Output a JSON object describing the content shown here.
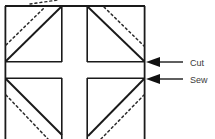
{
  "figure": {
    "background_color": "#ffffff",
    "line_color": "#1a1a1a",
    "dash_color": "#2b2b2b",
    "label_color": "#3a3a3a",
    "canvas": {
      "width": 215,
      "height": 139
    }
  },
  "block": {
    "outer_square": {
      "x": 5,
      "y": 6,
      "width": 140,
      "height": 140
    },
    "gap_cross": {
      "vertical_gap": {
        "x1": 62,
        "x2": 87
      },
      "horizontal_gap": {
        "y1": 62,
        "y2": 78
      }
    },
    "quadrants": [
      {
        "name": "top-left",
        "x": 5,
        "y": 6,
        "width": 57,
        "height": 56,
        "solid_diagonal": "bottom-left-to-top-right",
        "dashed_offset_direction": "up-left"
      },
      {
        "name": "top-right",
        "x": 87,
        "y": 6,
        "width": 58,
        "height": 56,
        "solid_diagonal": "top-left-to-bottom-right",
        "dashed_offset_direction": "up-right"
      },
      {
        "name": "bottom-left",
        "x": 5,
        "y": 78,
        "width": 57,
        "height": 61,
        "solid_diagonal": "top-left-to-bottom-right",
        "dashed_offset_direction": "down-left"
      },
      {
        "name": "bottom-right",
        "x": 87,
        "y": 78,
        "width": 58,
        "height": 61,
        "solid_diagonal": "bottom-left-to-top-right",
        "dashed_offset_direction": "down-right"
      }
    ],
    "top_stray_dashes": true
  },
  "annotations": [
    {
      "id": "cut",
      "label": "Cut",
      "arrow": {
        "tip_x": 146,
        "tip_y": 62,
        "tail_x": 180,
        "tail_y": 62
      },
      "text_x": 190,
      "text_y": 65
    },
    {
      "id": "sew",
      "label": "Sew",
      "arrow": {
        "tip_x": 146,
        "tip_y": 79,
        "tail_x": 180,
        "tail_y": 79
      },
      "text_x": 190,
      "text_y": 82
    }
  ]
}
